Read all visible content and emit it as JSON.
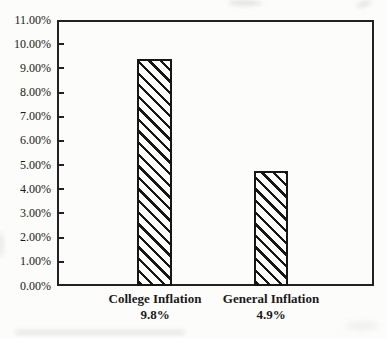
{
  "chart_data": {
    "type": "bar",
    "title": "",
    "xlabel": "",
    "ylabel": "",
    "categories": [
      "College Inflation",
      "General Inflation"
    ],
    "values": [
      9.8,
      4.9
    ],
    "value_labels": [
      "9.8%",
      "4.9%"
    ],
    "drawn_bar_top_values": [
      9.4,
      4.75
    ],
    "ylim": [
      0,
      11
    ],
    "ytick_step": 1,
    "ytick_labels_top_to_bottom": [
      "11.00%",
      "10.00%",
      "9.00%",
      "8.00%",
      "7.00%",
      "6.00%",
      "5.00%",
      "4.00%",
      "3.00%",
      "2.00%",
      "1.00%",
      "0.00%"
    ],
    "grid": false,
    "legend": "none",
    "bar_style": {
      "fill": "#fdfdfc",
      "hatch": "diagonal-backslash",
      "line_color": "#161616"
    },
    "colors": {
      "axis": "#222222",
      "text": "#1a1a1a",
      "background": "#fcfcfa"
    }
  }
}
